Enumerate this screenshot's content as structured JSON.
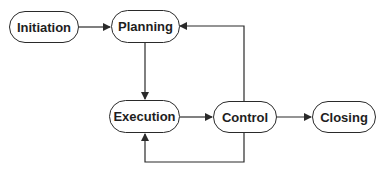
{
  "diagram": {
    "type": "flowchart",
    "title": "",
    "colors": {
      "stroke": "#2a2a2a",
      "text": "#1e1e1e",
      "background": "#ffffff"
    },
    "nodes": [
      {
        "id": "initiation",
        "label": "Initiation"
      },
      {
        "id": "planning",
        "label": "Planning"
      },
      {
        "id": "execution",
        "label": "Execution"
      },
      {
        "id": "control",
        "label": "Control"
      },
      {
        "id": "closing",
        "label": "Closing"
      }
    ],
    "edges": [
      {
        "from": "initiation",
        "to": "planning"
      },
      {
        "from": "planning",
        "to": "execution"
      },
      {
        "from": "execution",
        "to": "control"
      },
      {
        "from": "control",
        "to": "planning"
      },
      {
        "from": "control",
        "to": "execution"
      },
      {
        "from": "control",
        "to": "closing"
      }
    ]
  }
}
